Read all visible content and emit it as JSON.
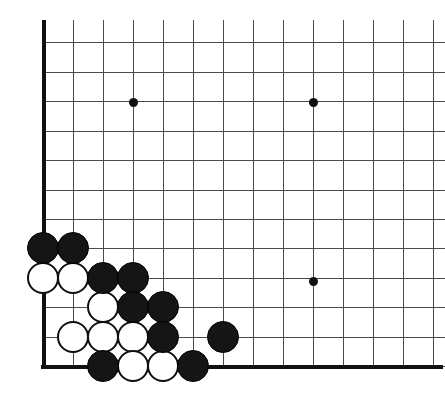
{
  "figure": {
    "kind": "go-board-diagram",
    "width": 445,
    "height": 409,
    "background_color": "#ffffff"
  },
  "board": {
    "visible_columns": 14,
    "visible_rows": 12,
    "cell_size_x": 30,
    "cell_size_y": 29.5,
    "origin_x": 43,
    "origin_y": 366,
    "grid_line_color": "#4a4a4a",
    "edge_line_color": "#111111",
    "edge_line_width": 4,
    "edges": [
      {
        "name": "left-edge",
        "orientation": "v",
        "x": 43,
        "y1": 20,
        "y2": 368
      },
      {
        "name": "bottom-edge",
        "orientation": "h",
        "y": 366,
        "x1": 41,
        "x2": 443
      }
    ],
    "column_x": [
      43,
      73,
      103,
      133,
      163,
      193,
      223,
      253,
      283,
      313,
      343,
      373,
      403,
      433
    ],
    "row_y": [
      42,
      72,
      101,
      131,
      160,
      190,
      219,
      248,
      278,
      307,
      337,
      366
    ],
    "star_points": [
      {
        "label": "upper-left-star",
        "x": 133,
        "y": 102
      },
      {
        "label": "upper-right-star",
        "x": 313,
        "y": 102
      },
      {
        "label": "lower-right-star",
        "x": 313,
        "y": 281
      }
    ]
  },
  "stones": [
    {
      "id": "b1",
      "color": "black",
      "x": 43,
      "y": 248
    },
    {
      "id": "b2",
      "color": "black",
      "x": 73,
      "y": 248
    },
    {
      "id": "w1",
      "color": "white",
      "x": 43,
      "y": 278
    },
    {
      "id": "w2",
      "color": "white",
      "x": 73,
      "y": 278
    },
    {
      "id": "b3",
      "color": "black",
      "x": 103,
      "y": 278
    },
    {
      "id": "b4",
      "color": "black",
      "x": 133,
      "y": 278
    },
    {
      "id": "w3",
      "color": "white",
      "x": 103,
      "y": 307
    },
    {
      "id": "b5",
      "color": "black",
      "x": 133,
      "y": 307
    },
    {
      "id": "b6",
      "color": "black",
      "x": 163,
      "y": 307
    },
    {
      "id": "w4",
      "color": "white",
      "x": 73,
      "y": 337
    },
    {
      "id": "w5",
      "color": "white",
      "x": 103,
      "y": 337
    },
    {
      "id": "w6",
      "color": "white",
      "x": 133,
      "y": 337
    },
    {
      "id": "b7",
      "color": "black",
      "x": 163,
      "y": 337
    },
    {
      "id": "b8",
      "color": "black",
      "x": 223,
      "y": 337
    },
    {
      "id": "b9",
      "color": "black",
      "x": 103,
      "y": 366
    },
    {
      "id": "w7",
      "color": "white",
      "x": 133,
      "y": 366
    },
    {
      "id": "w8",
      "color": "white",
      "x": 163,
      "y": 366
    },
    {
      "id": "b10",
      "color": "black",
      "x": 193,
      "y": 366
    }
  ],
  "colors": {
    "black_stone": "#151515",
    "white_stone": "#ffffff",
    "stone_outline": "#0f0f0f",
    "grid": "#4a4a4a",
    "edge": "#111111"
  }
}
